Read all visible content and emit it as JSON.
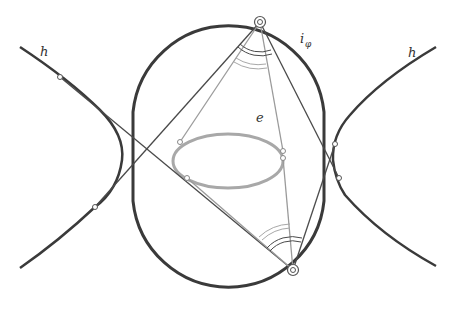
{
  "diagram": {
    "type": "geometric-construction",
    "labels": {
      "hyperbola_left": "h",
      "hyperbola_right": "h",
      "ellipse": "e",
      "isoptic_main": "i",
      "isoptic_sub": "φ"
    },
    "colors": {
      "curve_dark": "#3a3a3a",
      "curve_light": "#a8a8a8",
      "line_dark": "#4a4a4a",
      "line_light": "#9a9a9a",
      "point_fill": "#ffffff"
    },
    "points": {
      "top_vertex": [
        260,
        22
      ],
      "bottom_vertex": [
        293,
        270
      ]
    },
    "elements": [
      "isoptic curve i_φ (stadium-like closed curve)",
      "ellipse e",
      "hyperbola h (two branches)",
      "tangent lines from vertices",
      "angle arcs at top and bottom vertices"
    ]
  }
}
